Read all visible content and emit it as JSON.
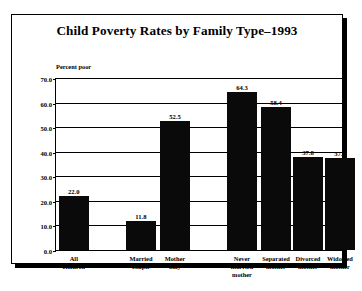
{
  "chart_data": {
    "type": "bar",
    "title": "Child Poverty Rates by Family Type–1993",
    "xlabel": "",
    "ylabel": "Percent poor",
    "ylim": [
      0,
      70
    ],
    "ytick_labels": [
      "70.0",
      "60.0",
      "50.0",
      "40.0",
      "30.0",
      "20.0",
      "10.0",
      "0.0"
    ],
    "ytick_values": [
      70,
      60,
      50,
      40,
      30,
      20,
      10,
      0
    ],
    "grid": true,
    "legend": false,
    "categories": [
      "All children",
      "Married\ncouple",
      "Mother\nonly",
      "Never\nmarried\nmother",
      "Separated\nmother",
      "Divorced\nmother",
      "Widowed\nmother"
    ],
    "values": [
      22.0,
      11.8,
      52.5,
      64.3,
      58.4,
      37.8,
      37.4
    ],
    "value_labels": [
      "22.0",
      "11.8",
      "52.5",
      "64.3",
      "58.4",
      "37.8",
      "37.4"
    ],
    "bar_color": "#0a0a0a",
    "bars": [
      {
        "label": "All children",
        "value": 22.0,
        "value_label": "22.0",
        "left_pct": 1.0,
        "width_pct": 10.4
      },
      {
        "label": "Married\ncouple",
        "value": 11.8,
        "value_label": "11.8",
        "left_pct": 24.3,
        "width_pct": 10.4
      },
      {
        "label": "Mother\nonly",
        "value": 52.5,
        "value_label": "52.5",
        "left_pct": 36.1,
        "width_pct": 10.4
      },
      {
        "label": "Never\nmarried\nmother",
        "value": 64.3,
        "value_label": "64.3",
        "left_pct": 59.4,
        "width_pct": 10.4
      },
      {
        "label": "Separated\nmother",
        "value": 58.4,
        "value_label": "58.4",
        "left_pct": 71.2,
        "width_pct": 10.4
      },
      {
        "label": "Divorced\nmother",
        "value": 37.8,
        "value_label": "37.8",
        "left_pct": 82.3,
        "width_pct": 10.4
      },
      {
        "label": "Widowed\nmother",
        "value": 37.4,
        "value_label": "37.4",
        "left_pct": 93.4,
        "width_pct": 10.4
      }
    ]
  }
}
